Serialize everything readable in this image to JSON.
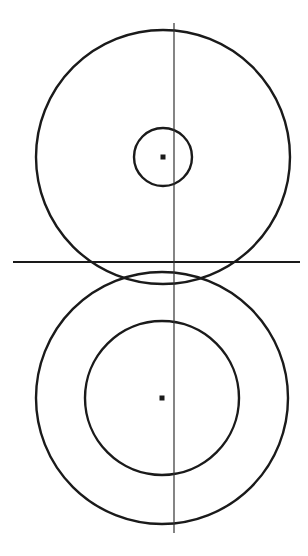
{
  "diagram": {
    "title": "",
    "stroke_color": "#1a1a1a",
    "thin_line_color": "#333333",
    "background": "#ffffff",
    "top_assembly": {
      "center": [
        163,
        157
      ],
      "outer_circle": {
        "r": 127
      },
      "inner_circle": {
        "r": 29
      },
      "center_mark": {
        "size": 5
      }
    },
    "bottom_assembly": {
      "center": [
        162,
        398
      ],
      "outer_circle": {
        "r": 126
      },
      "inner_circle": {
        "r": 77
      },
      "center_mark": {
        "size": 5
      }
    },
    "horizontal_line": {
      "x1": 13,
      "y1": 262,
      "x2": 300,
      "y2": 262
    },
    "vertical_line": {
      "x1": 174,
      "y1": 23,
      "x2": 174,
      "y2": 533
    }
  }
}
